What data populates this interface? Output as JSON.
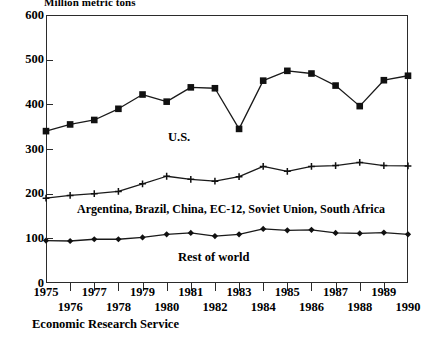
{
  "chart_data": {
    "type": "line",
    "title": "Million metric tons",
    "xlabel": "",
    "ylabel": "Million metric tons",
    "x": [
      1975,
      1976,
      1977,
      1978,
      1979,
      1980,
      1981,
      1982,
      1983,
      1984,
      1985,
      1986,
      1987,
      1988,
      1989,
      1990
    ],
    "categories": [
      "1975",
      "1976",
      "1977",
      "1978",
      "1979",
      "1980",
      "1981",
      "1982",
      "1983",
      "1984",
      "1985",
      "1986",
      "1987",
      "1988",
      "1989",
      "1990"
    ],
    "ylim": [
      0,
      600
    ],
    "yticks": [
      0,
      100,
      200,
      300,
      400,
      500,
      600
    ],
    "ytick_labels": [
      "0",
      "100",
      "200",
      "300",
      "400",
      "500",
      "600"
    ],
    "xlim": [
      1975,
      1990
    ],
    "grid": false,
    "legend_position": "inline-annotations",
    "series": [
      {
        "name": "U.S.",
        "marker": "filled-square",
        "values": [
          340,
          355,
          365,
          390,
          422,
          406,
          438,
          436,
          345,
          453,
          475,
          469,
          442,
          396,
          454,
          464
        ]
      },
      {
        "name": "Argentina, Brazil, China, EC-12, Soviet Union, South Africa",
        "marker": "plus",
        "values": [
          190,
          196,
          200,
          205,
          222,
          239,
          232,
          228,
          238,
          261,
          250,
          261,
          263,
          270,
          263,
          262
        ]
      },
      {
        "name": "Rest of world",
        "marker": "filled-diamond",
        "values": [
          95,
          94,
          98,
          98,
          102,
          109,
          112,
          105,
          109,
          121,
          118,
          119,
          112,
          111,
          113,
          109
        ]
      }
    ],
    "annotations": [
      {
        "id": "us",
        "text": "U.S."
      },
      {
        "id": "six_countries",
        "text": "Argentina, Brazil, China, EC-12, Soviet Union, South Africa"
      },
      {
        "id": "rest_of_world",
        "text": "Rest of world"
      }
    ],
    "source_note": "Economic Research Service",
    "colors": {
      "axis": "#2b2b2b",
      "series_line": "#1a1a1a",
      "marker": "#111111",
      "background": "#ffffff"
    }
  }
}
